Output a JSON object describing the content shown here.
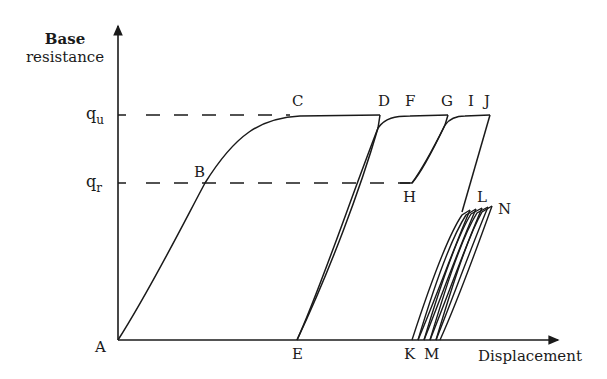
{
  "diagram": {
    "type": "hysteresis load-displacement diagram",
    "axes": {
      "y_label_line1": "Base",
      "y_label_line2": "resistance",
      "x_label": "Displacement"
    },
    "levels": {
      "qu": {
        "base": "q",
        "sub": "u"
      },
      "qr": {
        "base": "q",
        "sub": "r"
      }
    },
    "points": {
      "A": "A",
      "B": "B",
      "C": "C",
      "D": "D",
      "E": "E",
      "F": "F",
      "G": "G",
      "H": "H",
      "I": "I",
      "J": "J",
      "K": "K",
      "L": "L",
      "M": "M",
      "N": "N"
    },
    "colors": {
      "line": "#1a1a1a",
      "background": "#ffffff"
    }
  }
}
